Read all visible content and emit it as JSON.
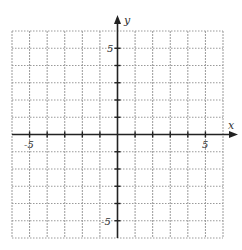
{
  "chart_data": {
    "type": "scatter",
    "title": "",
    "xlabel": "x",
    "ylabel": "y",
    "xlim": [
      -6,
      6
    ],
    "ylim": [
      -6,
      6
    ],
    "grid": true,
    "grid_step": 1,
    "x_tick_labels": [
      {
        "value": -5,
        "label": "-5"
      },
      {
        "value": 5,
        "label": "5"
      }
    ],
    "y_tick_labels": [
      {
        "value": 5,
        "label": "5"
      },
      {
        "value": -5,
        "label": "-5"
      }
    ],
    "series": [],
    "legend": null
  },
  "axes": {
    "x_label": "x",
    "y_label": "y",
    "x_neg_tick": "-5",
    "x_pos_tick": "5",
    "y_pos_tick": "5",
    "y_neg_tick": "-5"
  },
  "colors": {
    "grid": "#9a9a9a",
    "axis": "#222222",
    "text": "#333333"
  }
}
